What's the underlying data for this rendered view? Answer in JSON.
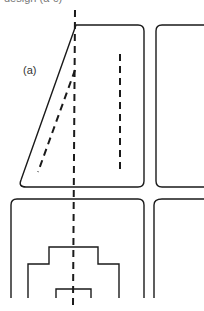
{
  "figure": {
    "clipped_caption": "design (a-c)",
    "panel_label": "(a)"
  },
  "colors": {
    "stroke": "#1a1a1a",
    "background": "#ffffff"
  }
}
